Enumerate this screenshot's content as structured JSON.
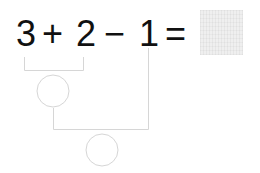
{
  "equation": {
    "tokens": [
      "3",
      "+",
      "2",
      "−",
      "1",
      "="
    ],
    "answer": ""
  },
  "diagram": {
    "line_color": "#d6d6d6",
    "first_step_circle": {
      "label": ""
    },
    "second_step_circle": {
      "label": ""
    }
  }
}
